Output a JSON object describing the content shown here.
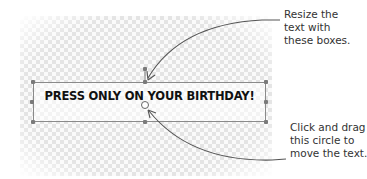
{
  "canvas": {
    "background": "transparent-checkerboard",
    "checker_color": "#e4e4e4"
  },
  "textbox": {
    "text": "PRESS ONLY ON YOUR BIRTHDAY!",
    "border_color": "#8a8a8a",
    "handles": [
      "top-left",
      "top-center",
      "top-right",
      "middle-left",
      "middle-right",
      "bottom-left",
      "bottom-center",
      "bottom-right"
    ],
    "move_handle": "circle"
  },
  "callouts": [
    {
      "id": "resize",
      "lines": [
        "Resize the",
        "text with",
        "these boxes."
      ],
      "points_to": "resize-handle"
    },
    {
      "id": "move",
      "lines": [
        "Click and drag",
        "this circle to",
        "move the text."
      ],
      "points_to": "move-circle"
    }
  ],
  "colors": {
    "arrow": "#555555",
    "text": "#111111",
    "callout_text": "#333333"
  }
}
